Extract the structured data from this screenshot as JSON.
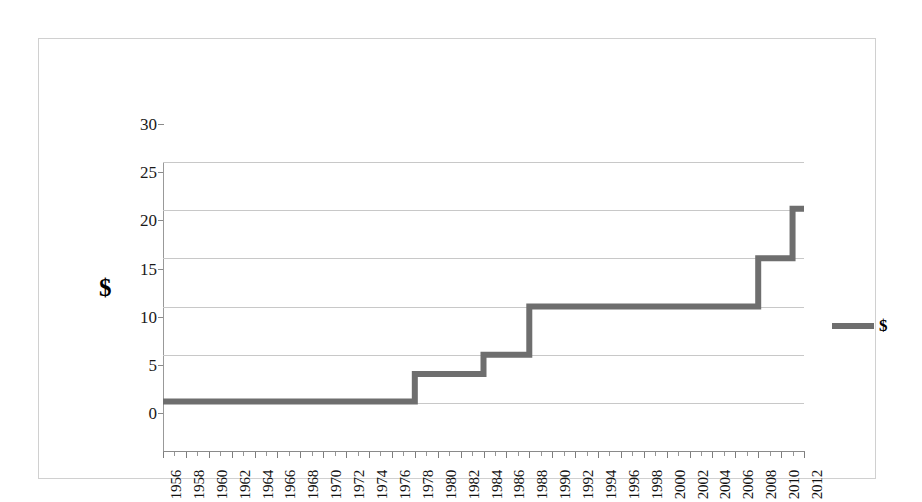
{
  "chart_data": {
    "type": "line",
    "title": "",
    "xlabel": "",
    "ylabel": "$",
    "legend": [
      {
        "name": "$",
        "color": "#6e6e6e"
      }
    ],
    "legend_position": "right",
    "grid": true,
    "xlim": [
      1956,
      2012
    ],
    "ylim": [
      0,
      30
    ],
    "ytick_labels": [
      "0",
      "5",
      "10",
      "15",
      "20",
      "25",
      "30"
    ],
    "yticks": [
      0,
      5,
      10,
      15,
      20,
      25,
      30
    ],
    "xtick_labels": [
      "1956",
      "1958",
      "1960",
      "1962",
      "1964",
      "1966",
      "1968",
      "1970",
      "1972",
      "1974",
      "1976",
      "1978",
      "1980",
      "1982",
      "1984",
      "1986",
      "1988",
      "1990",
      "1992",
      "1994",
      "1996",
      "1998",
      "2000",
      "2002",
      "2004",
      "2006",
      "2008",
      "2010",
      "2012"
    ],
    "xticks": [
      1956,
      1958,
      1960,
      1962,
      1964,
      1966,
      1968,
      1970,
      1972,
      1974,
      1976,
      1978,
      1980,
      1982,
      1984,
      1986,
      1988,
      1990,
      1992,
      1994,
      1996,
      1998,
      2000,
      2002,
      2004,
      2006,
      2008,
      2010,
      2012
    ],
    "series": [
      {
        "name": "$",
        "color": "#6e6e6e",
        "step": true,
        "x": [
          1956,
          1957,
          1958,
          1959,
          1960,
          1961,
          1962,
          1963,
          1964,
          1965,
          1966,
          1967,
          1968,
          1969,
          1970,
          1971,
          1972,
          1973,
          1974,
          1975,
          1976,
          1977,
          1978,
          1979,
          1980,
          1981,
          1982,
          1983,
          1984,
          1985,
          1986,
          1987,
          1988,
          1989,
          1990,
          1991,
          1992,
          1993,
          1994,
          1995,
          1996,
          1997,
          1998,
          1999,
          2000,
          2001,
          2002,
          2003,
          2004,
          2005,
          2006,
          2007,
          2008,
          2009,
          2010,
          2011,
          2012
        ],
        "y": [
          5.15,
          5.15,
          5.15,
          5.15,
          5.15,
          5.15,
          5.15,
          5.15,
          5.15,
          5.15,
          5.15,
          5.15,
          5.15,
          5.15,
          5.15,
          5.15,
          5.15,
          5.15,
          5.15,
          5.15,
          5.15,
          5.15,
          8,
          8,
          8,
          8,
          8,
          8,
          10,
          10,
          10,
          10,
          15,
          15,
          15,
          15,
          15,
          15,
          15,
          15,
          15,
          15,
          15,
          15,
          15,
          15,
          15,
          15,
          15,
          15,
          15,
          15,
          20,
          20,
          20,
          25.15,
          25.15
        ]
      }
    ]
  },
  "legend": {
    "label": "$"
  },
  "axis": {
    "y_title": "$"
  }
}
